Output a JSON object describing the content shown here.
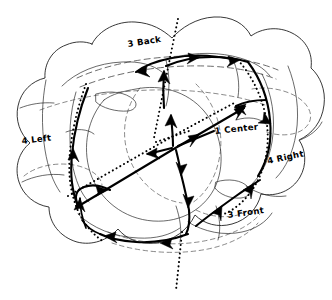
{
  "diagram": {
    "style": "pen-and-ink sketch, black ink on white paper",
    "background_color": "#ffffff",
    "ink_color": "#000000",
    "width": 332,
    "height": 300,
    "labels": [
      {
        "id": "back",
        "text": "3 Back",
        "x": 128,
        "y": 47,
        "rotate": -9,
        "icon": "handwritten-label"
      },
      {
        "id": "center",
        "text": "1 Center",
        "x": 215,
        "y": 134,
        "rotate": -6,
        "icon": "handwritten-label"
      },
      {
        "id": "left",
        "text": "4 Left",
        "x": 22,
        "y": 144,
        "rotate": -7,
        "icon": "handwritten-label"
      },
      {
        "id": "right",
        "text": "4 Right",
        "x": 268,
        "y": 164,
        "rotate": -12,
        "icon": "handwritten-label"
      },
      {
        "id": "front",
        "text": "3 Front",
        "x": 228,
        "y": 218,
        "rotate": -8,
        "icon": "handwritten-label"
      }
    ],
    "line_styles": [
      {
        "id": "solid-outline",
        "name": "Solid outline",
        "description": "lobe and region boundaries"
      },
      {
        "id": "dashed-guide",
        "name": "Dashed guide",
        "description": "hidden / far-side edges"
      },
      {
        "id": "dotted-seam",
        "name": "Dotted seam",
        "description": "major dividing seams"
      },
      {
        "id": "flow-arrow",
        "name": "Flow arrow",
        "description": "thick directed pathways"
      }
    ],
    "regions": [
      {
        "id": "center",
        "label": "1 Center",
        "count": 1
      },
      {
        "id": "back",
        "label": "3 Back",
        "count": 3
      },
      {
        "id": "front",
        "label": "3 Front",
        "count": 3
      },
      {
        "id": "left",
        "label": "4 Left",
        "count": 4
      },
      {
        "id": "right",
        "label": "4 Right",
        "count": 4
      }
    ],
    "junction": {
      "id": "center-junction",
      "x": 175,
      "y": 145,
      "branches": 4
    }
  }
}
